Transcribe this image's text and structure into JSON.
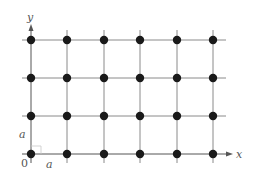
{
  "diagram": {
    "type": "square-lattice",
    "colors": {
      "line": "#8a8a8a",
      "point": "#1a1a1a",
      "text": "#555555"
    },
    "grid": {
      "columns_x": [
        31,
        67,
        104,
        140,
        177,
        213
      ],
      "rows_y": [
        40,
        78,
        116,
        154
      ],
      "line_extent": {
        "x_min": 22,
        "x_max": 226,
        "y_min": 30,
        "y_max": 163
      }
    },
    "axes": {
      "x_label": "x",
      "y_label": "y",
      "origin_label": "0"
    },
    "annotations": {
      "spacing_horizontal": "a",
      "spacing_vertical": "a"
    }
  }
}
